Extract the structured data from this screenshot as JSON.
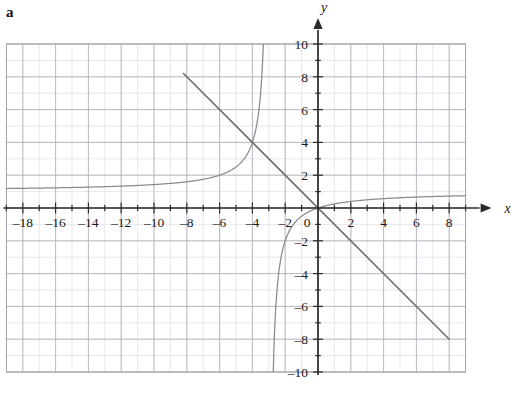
{
  "figure": {
    "part_label": "a",
    "background_color": "#ffffff"
  },
  "axes": {
    "x_axis_name": "x",
    "y_axis_name": "y",
    "origin_label": "0",
    "x_tick_labels": [
      "–18",
      "–16",
      "–14",
      "–12",
      "–10",
      "–8",
      "–6",
      "–4",
      "–2",
      "2",
      "4",
      "6",
      "8"
    ],
    "y_tick_labels": [
      "10",
      "8",
      "6",
      "4",
      "2",
      "–2",
      "–4",
      "–6",
      "–8",
      "–10"
    ],
    "axis_color": "#2b2b2b",
    "grid_major_color": "#a9a9b4",
    "grid_minor_color": "#d4d4dc"
  },
  "chart_data": {
    "type": "line",
    "title": "",
    "subtitle": "",
    "xlabel": "x",
    "ylabel": "y",
    "xlim": [
      -19,
      9
    ],
    "ylim": [
      -10,
      10
    ],
    "x_major_step": 2,
    "x_minor_step": 1,
    "y_major_step": 2,
    "y_minor_step": 1,
    "grid": true,
    "legend": "none",
    "grid_x_range": [
      -19,
      9
    ],
    "grid_y_range": [
      -10,
      10
    ],
    "curve_color": "#8a8a8a",
    "line_color": "#6f6f6f",
    "series": [
      {
        "name": "rational-curve",
        "type": "rational",
        "description": "Rational function with vertical asymptote at x = -3 and horizontal asymptote y = 1; passes through the origin.",
        "expression": "y = x/(x+3)",
        "vertical_asymptote_x": -3,
        "horizontal_asymptote_y": 1,
        "x_intercept": 0,
        "y_intercept": 0,
        "left_branch_points": [
          [
            -19,
            1.1875
          ],
          [
            -18,
            1.2
          ],
          [
            -17,
            1.2143
          ],
          [
            -16,
            1.2308
          ],
          [
            -15,
            1.25
          ],
          [
            -14,
            1.2727
          ],
          [
            -13,
            1.3
          ],
          [
            -12,
            1.3333
          ],
          [
            -11,
            1.375
          ],
          [
            -10,
            1.4286
          ],
          [
            -9,
            1.5
          ],
          [
            -8,
            1.6
          ],
          [
            -7,
            1.75
          ],
          [
            -6,
            2.0
          ],
          [
            -5.5,
            2.2
          ],
          [
            -5,
            2.5
          ],
          [
            -4.5,
            3.0
          ],
          [
            -4.2,
            3.5
          ],
          [
            -4,
            4.0
          ],
          [
            -3.8,
            4.75
          ],
          [
            -3.6,
            6.0
          ],
          [
            -3.45,
            7.667
          ],
          [
            -3.35,
            9.571
          ],
          [
            -3.31,
            10.68
          ]
        ],
        "right_branch_points": [
          [
            -2.69,
            -8.71
          ],
          [
            -2.75,
            -11.0
          ],
          [
            -2.8,
            -14.0
          ],
          [
            -2.6,
            -6.5
          ],
          [
            -2.5,
            -5.0
          ],
          [
            -2.4,
            -4.0
          ],
          [
            -2.25,
            -3.0
          ],
          [
            -2.0,
            -2.0
          ],
          [
            -1.75,
            -1.4
          ],
          [
            -1.5,
            -1.0
          ],
          [
            -1.0,
            -0.5
          ],
          [
            -0.5,
            -0.2
          ],
          [
            0,
            0
          ],
          [
            1,
            0.25
          ],
          [
            2,
            0.4
          ],
          [
            3,
            0.5
          ],
          [
            4,
            0.5714
          ],
          [
            5,
            0.625
          ],
          [
            6,
            0.6667
          ],
          [
            7,
            0.7
          ],
          [
            8,
            0.7273
          ],
          [
            9,
            0.75
          ]
        ]
      },
      {
        "name": "straight-line",
        "type": "line",
        "description": "Straight line of slope -1 through the origin",
        "expression": "y = -x",
        "slope": -1,
        "intercept": 0,
        "endpoints": [
          [
            -8.2,
            8.2
          ],
          [
            8,
            -8
          ]
        ]
      }
    ],
    "annotations": [
      {
        "text": "intersection",
        "x": -4,
        "y": 4,
        "visible": false
      }
    ]
  }
}
